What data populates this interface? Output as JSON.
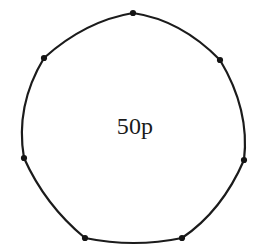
{
  "figure": {
    "name": "fifty-pence-coin-outline",
    "background_color": "#ffffff",
    "stroke_color": "#1b1b1b",
    "stroke_width": 2.2,
    "vertex_color": "#141414",
    "vertex_radius": 3.1,
    "label": {
      "text": "50p",
      "color": "#1b1b1b",
      "font_size": 24,
      "x": 135,
      "y": 134
    },
    "vertices": [
      {
        "name": "top",
        "x": 133,
        "y": 13
      },
      {
        "name": "upper-right",
        "x": 220,
        "y": 60
      },
      {
        "name": "right",
        "x": 244,
        "y": 160
      },
      {
        "name": "bottom-right",
        "x": 182,
        "y": 238
      },
      {
        "name": "bottom-left",
        "x": 85,
        "y": 238
      },
      {
        "name": "left",
        "x": 24,
        "y": 158
      },
      {
        "name": "upper-left",
        "x": 44,
        "y": 58
      }
    ],
    "outline_path": "M 133 13 Q 181 20 220 60 Q 250 110 244 160 Q 222 211 182 238 Q 134 248 85 238 Q 45 205 24 158 Q 15 106 44 58 Q 85 21 133 13 Z"
  }
}
